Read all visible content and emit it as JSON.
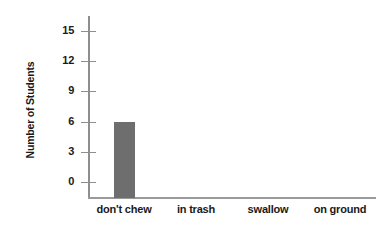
{
  "chart_data": {
    "type": "bar",
    "title": "",
    "xlabel": "",
    "ylabel": "Number of Students",
    "categories": [
      "don't chew",
      "in trash",
      "swallow",
      "on ground"
    ],
    "values": [
      6,
      0,
      0,
      0
    ],
    "series": [
      {
        "name": "Number of Students",
        "values": [
          6,
          0,
          0,
          0
        ]
      }
    ],
    "ylim": [
      0,
      15
    ],
    "yticks": [
      0,
      3,
      6,
      9,
      12,
      15
    ],
    "ytick_labels": [
      "0",
      "3",
      "6",
      "9",
      "12",
      "15"
    ],
    "grid": false,
    "legend": false,
    "legend_position": "none",
    "colors": {
      "bar": "#6e6e6e",
      "axis": "#9a9a9a",
      "text": "#1a1a1a",
      "background": "#ffffff"
    }
  }
}
